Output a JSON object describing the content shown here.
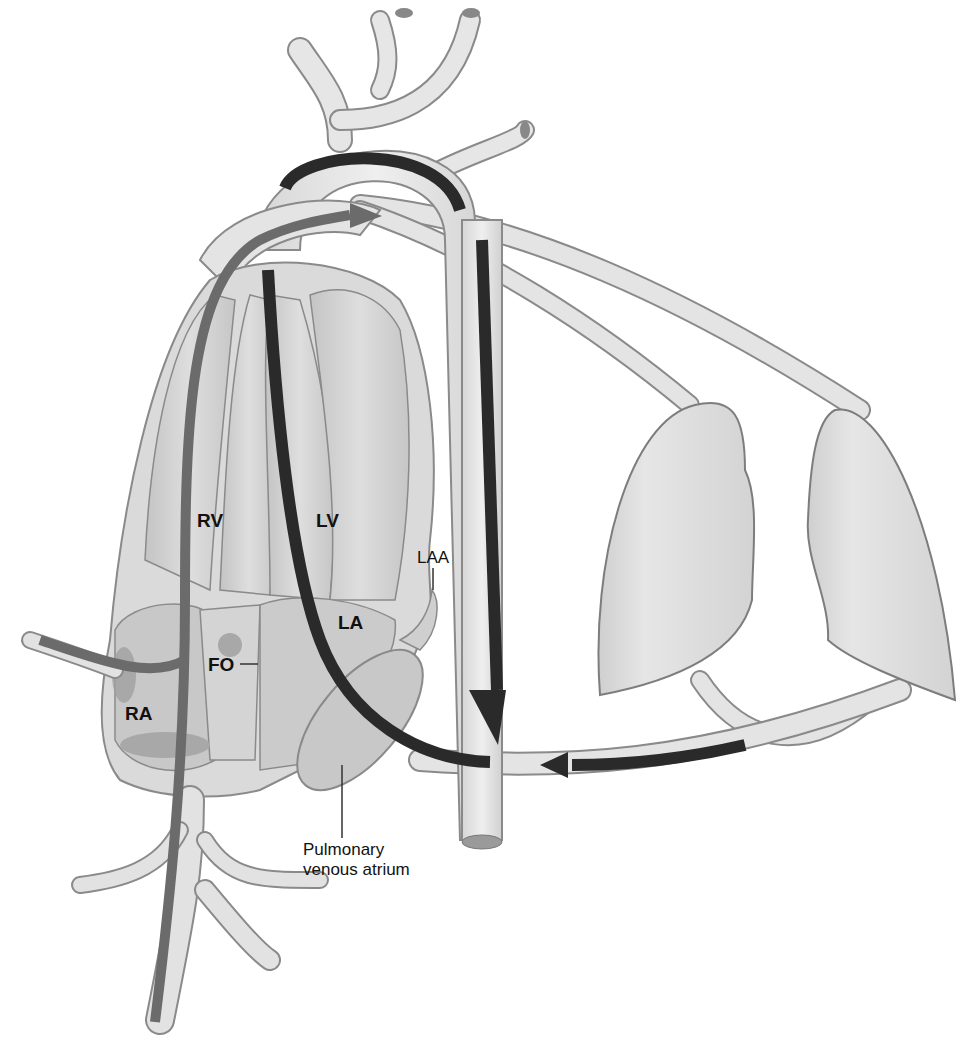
{
  "diagram": {
    "type": "anatomical circulation diagram",
    "labels": {
      "rv": "RV",
      "lv": "LV",
      "laa": "LAA",
      "la": "LA",
      "fo": "FO",
      "ra": "RA",
      "pva_line1": "Pulmonary",
      "pva_line2": "venous atrium"
    },
    "colors": {
      "vessel_fill": "#e2e2e2",
      "vessel_stroke": "#8a8a8a",
      "chamber_fill": "#cfcfcf",
      "dark_arrow": "#2a2a2a",
      "medium_arrow": "#6b6b6b",
      "lung_fill": "#dcdcdc"
    },
    "flows": [
      {
        "name": "aortic-arch-flow",
        "shade": "dark"
      },
      {
        "name": "descending-aorta-flow",
        "shade": "dark",
        "direction": "down"
      },
      {
        "name": "pulmonary-return-flow",
        "shade": "dark",
        "direction": "left"
      },
      {
        "name": "left-heart-flow",
        "shade": "dark"
      },
      {
        "name": "systemic-venous-flow",
        "shade": "medium",
        "direction": "up-right"
      }
    ]
  }
}
